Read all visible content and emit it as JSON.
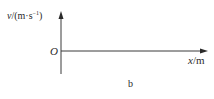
{
  "figure": {
    "caption": "b",
    "y_axis": {
      "variable": "v",
      "unit_prefix": "/(m·s",
      "unit_exponent": "−1",
      "unit_suffix": ")"
    },
    "x_axis": {
      "variable": "x",
      "unit": "/m"
    },
    "origin_label": "O",
    "colors": {
      "axis": "#3a3a3a",
      "text": "#2a2a2a",
      "background": "#ffffff"
    }
  }
}
